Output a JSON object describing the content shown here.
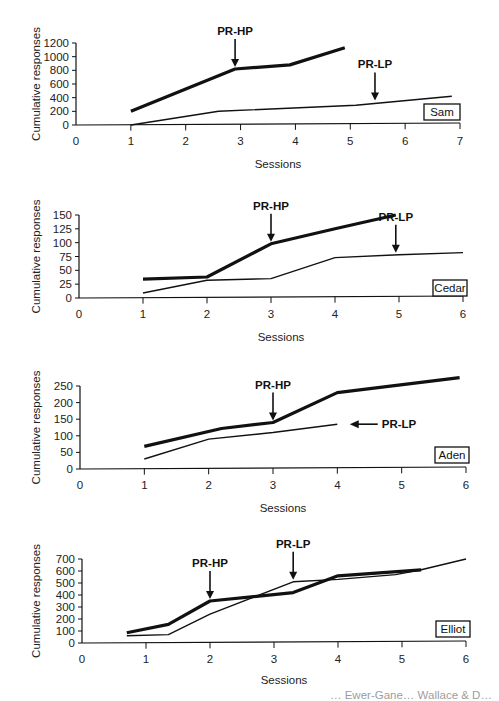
{
  "chart_data": [
    {
      "type": "line",
      "subject": "Sam",
      "xlabel": "Sessions",
      "ylabel": "Cumulative responses",
      "xlim": [
        0,
        7
      ],
      "ylim": [
        0,
        1200
      ],
      "xticks": [
        0,
        1,
        2,
        3,
        4,
        5,
        6,
        7
      ],
      "yticks": [
        0,
        200,
        400,
        600,
        800,
        1000,
        1200
      ],
      "series": [
        {
          "name": "high-preference (thick)",
          "x": [
            1,
            2.9,
            3.9,
            4.9
          ],
          "y": [
            200,
            820,
            880,
            1130
          ]
        },
        {
          "name": "low-preference (thin)",
          "x": [
            1,
            2.6,
            5.1,
            6.85
          ],
          "y": [
            0,
            200,
            290,
            420
          ]
        }
      ],
      "annotations": [
        {
          "text": "PR-HP",
          "x": 2.9,
          "y": 820,
          "arrow": "down"
        },
        {
          "text": "PR-LP",
          "x": 5.45,
          "y": 330,
          "arrow": "down"
        }
      ],
      "layout": {
        "x0": 76,
        "x1": 460,
        "y0": 125,
        "y1": 43,
        "label_y": 168,
        "subject_box": [
          424,
          104,
          36,
          16
        ]
      }
    },
    {
      "type": "line",
      "subject": "Cedar",
      "xlabel": "Sessions",
      "ylabel": "Cumulative responses",
      "xlim": [
        0,
        6
      ],
      "ylim": [
        0,
        150
      ],
      "xticks": [
        0,
        1,
        2,
        3,
        4,
        5,
        6
      ],
      "yticks": [
        0,
        25,
        50,
        75,
        100,
        125,
        150
      ],
      "series": [
        {
          "name": "high-preference (thick)",
          "x": [
            1,
            2,
            3,
            4,
            4.95
          ],
          "y": [
            34,
            38,
            98,
            125,
            150
          ]
        },
        {
          "name": "low-preference (thin)",
          "x": [
            1,
            2,
            3,
            4,
            5,
            6
          ],
          "y": [
            9,
            32,
            35,
            73,
            78,
            82
          ]
        }
      ],
      "annotations": [
        {
          "text": "PR-HP",
          "x": 3,
          "y": 98,
          "arrow": "down"
        },
        {
          "text": "PR-LP",
          "x": 4.95,
          "y": 78,
          "arrow": "down"
        }
      ],
      "layout": {
        "x0": 79,
        "x1": 463,
        "y0": 298,
        "y1": 215,
        "label_y": 341,
        "subject_box": [
          433,
          280,
          34,
          16
        ]
      }
    },
    {
      "type": "line",
      "subject": "Aden",
      "xlabel": "Sessions",
      "ylabel": "Cumulative responses",
      "xlim": [
        0,
        6
      ],
      "ylim": [
        0,
        250
      ],
      "xticks": [
        0,
        1,
        2,
        3,
        4,
        5,
        6
      ],
      "yticks": [
        0,
        50,
        100,
        150,
        200,
        250
      ],
      "series": [
        {
          "name": "high-preference (thick)",
          "x": [
            1,
            2.2,
            3,
            4,
            5.9
          ],
          "y": [
            68,
            122,
            140,
            230,
            275
          ]
        },
        {
          "name": "low-preference (thin)",
          "x": [
            1,
            2,
            3,
            4
          ],
          "y": [
            30,
            90,
            110,
            135
          ]
        }
      ],
      "annotations": [
        {
          "text": "PR-HP",
          "x": 3,
          "y": 140,
          "arrow": "down"
        },
        {
          "text": "PR-LP",
          "x": 4.1,
          "y": 135,
          "arrow": "left"
        }
      ],
      "layout": {
        "x0": 80,
        "x1": 466,
        "y0": 469,
        "y1": 386,
        "label_y": 512,
        "subject_box": [
          435,
          447,
          34,
          16
        ]
      }
    },
    {
      "type": "line",
      "subject": "Elliot",
      "xlabel": "Sessions",
      "ylabel": "Cumulative responses",
      "xlim": [
        0,
        6
      ],
      "ylim": [
        0,
        700
      ],
      "xticks": [
        0,
        1,
        2,
        3,
        4,
        5,
        6
      ],
      "yticks": [
        0,
        100,
        200,
        300,
        400,
        500,
        600,
        700
      ],
      "series": [
        {
          "name": "high-preference (thick)",
          "x": [
            0.7,
            1.35,
            2,
            3.3,
            4,
            5.3
          ],
          "y": [
            85,
            155,
            350,
            420,
            560,
            610
          ]
        },
        {
          "name": "low-preference (thin)",
          "x": [
            0.7,
            1.35,
            2,
            3.3,
            4,
            4.9,
            5.3,
            6
          ],
          "y": [
            60,
            70,
            240,
            510,
            530,
            570,
            610,
            700
          ]
        }
      ],
      "annotations": [
        {
          "text": "PR-HP",
          "x": 2,
          "y": 350,
          "arrow": "down"
        },
        {
          "text": "PR-LP",
          "x": 3.3,
          "y": 510,
          "arrow": "down"
        }
      ],
      "layout": {
        "x0": 82,
        "x1": 466,
        "y0": 643,
        "y1": 559,
        "label_y": 684,
        "subject_box": [
          436,
          621,
          34,
          16
        ]
      }
    }
  ],
  "caption_fragment": "… Ewer-Gane… Wallace & D…"
}
